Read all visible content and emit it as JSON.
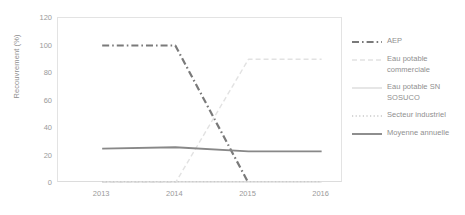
{
  "chart_data": {
    "type": "line",
    "title": "",
    "xlabel": "",
    "ylabel": "Recouvrement (%)",
    "x": [
      2013,
      2014,
      2015,
      2016
    ],
    "xtick_labels": [
      "2013",
      "2014",
      "2015",
      "2016"
    ],
    "ytick_labels": [
      "0",
      "20",
      "40",
      "60",
      "80",
      "100",
      "120"
    ],
    "ytick_values": [
      0,
      20,
      40,
      60,
      80,
      100,
      120
    ],
    "ylim": [
      0,
      120
    ],
    "xlim": [
      2013,
      2016
    ],
    "grid": false,
    "legend_position": "right",
    "series": [
      {
        "name": "AEP",
        "values": [
          100,
          100,
          0,
          null
        ],
        "color": "#7a7a7a",
        "style": "dash-dot",
        "width": 2.2
      },
      {
        "name": "Eau potable commerciale",
        "values": [
          0,
          0,
          90,
          90
        ],
        "color": "#e2e2e2",
        "style": "dashed",
        "width": 1.4
      },
      {
        "name": "Eau potable SN SOSUCO",
        "values": [
          0,
          0,
          0,
          0
        ],
        "color": "#d6d6d6",
        "style": "solid",
        "width": 1.2
      },
      {
        "name": "Secteur industriel",
        "values": [
          1,
          1,
          1,
          1
        ],
        "color": "#c9c9c9",
        "style": "dotted",
        "width": 1.4
      },
      {
        "name": "Moyenne annuelle",
        "values": [
          25,
          26,
          23,
          23
        ],
        "color": "#888888",
        "style": "solid",
        "width": 1.9
      }
    ]
  },
  "legend": {
    "items": [
      {
        "label": "AEP"
      },
      {
        "label": "Eau potable commerciale"
      },
      {
        "label": "Eau potable SN SOSUCO"
      },
      {
        "label": "Secteur industriel"
      },
      {
        "label": "Moyenne annuelle"
      }
    ]
  },
  "axes": {
    "y_title": "Recouvrement (%)"
  }
}
